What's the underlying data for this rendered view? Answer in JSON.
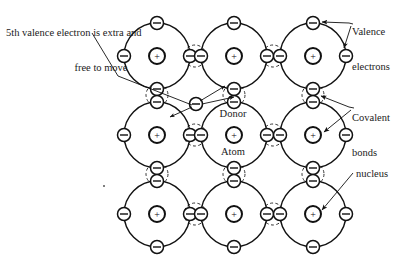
{
  "figure": {
    "background_color": "#ffffff",
    "ink_color": "#111111"
  },
  "labels": {
    "extra_electron_line1": "5th valence electron is extra and",
    "extra_electron_line2": "free to move",
    "valence_line1": "Valence",
    "valence_line2": "electrons",
    "covalent_line1": "Covalent",
    "covalent_line2": "bonds",
    "nucleus": "nucleus",
    "donor_line1": "Donor",
    "donor_line2": "Atom"
  },
  "symbols": {
    "nucleus_charge": "+",
    "electron_charge": "–"
  },
  "lattice": {
    "rows": 3,
    "cols": 3,
    "atom_radius": 33,
    "nucleus_outer_radius": 8,
    "nucleus_inner_radius": 5,
    "electron_radius": 6.5,
    "bond_circle_radius": 11,
    "atoms": [
      {
        "id": "atom-r1c1",
        "cx": 157,
        "cy": 56,
        "role": "lattice-atom"
      },
      {
        "id": "atom-r1c2",
        "cx": 234,
        "cy": 56,
        "role": "lattice-atom"
      },
      {
        "id": "atom-r1c3",
        "cx": 313,
        "cy": 56,
        "role": "lattice-atom"
      },
      {
        "id": "atom-r2c1",
        "cx": 157,
        "cy": 135,
        "role": "lattice-atom"
      },
      {
        "id": "atom-r2c2",
        "cx": 234,
        "cy": 135,
        "role": "donor-atom"
      },
      {
        "id": "atom-r2c3",
        "cx": 313,
        "cy": 135,
        "role": "lattice-atom"
      },
      {
        "id": "atom-r3c1",
        "cx": 157,
        "cy": 214,
        "role": "lattice-atom"
      },
      {
        "id": "atom-r3c2",
        "cx": 234,
        "cy": 214,
        "role": "lattice-atom"
      },
      {
        "id": "atom-r3c3",
        "cx": 313,
        "cy": 214,
        "role": "lattice-atom"
      }
    ],
    "horizontal_bonds": [
      {
        "id": "bond-h-r1c1c2",
        "cx": 195,
        "cy": 56
      },
      {
        "id": "bond-h-r1c2c3",
        "cx": 273,
        "cy": 56
      },
      {
        "id": "bond-h-r2c1c2",
        "cx": 195,
        "cy": 135
      },
      {
        "id": "bond-h-r2c2c3",
        "cx": 273,
        "cy": 135
      },
      {
        "id": "bond-h-r3c1c2",
        "cx": 195,
        "cy": 214
      },
      {
        "id": "bond-h-r3c2c3",
        "cx": 273,
        "cy": 214
      }
    ],
    "vertical_bonds": [
      {
        "id": "bond-v-c1r1r2",
        "cx": 157,
        "cy": 95
      },
      {
        "id": "bond-v-c2r1r2",
        "cx": 234,
        "cy": 95
      },
      {
        "id": "bond-v-c3r1r2",
        "cx": 313,
        "cy": 95
      },
      {
        "id": "bond-v-c1r2r3",
        "cx": 157,
        "cy": 174
      },
      {
        "id": "bond-v-c2r2r3",
        "cx": 234,
        "cy": 174
      },
      {
        "id": "bond-v-c3r2r3",
        "cx": 313,
        "cy": 174
      }
    ],
    "free_electron": {
      "id": "free-electron",
      "cx": 196,
      "cy": 104
    }
  },
  "leaders": {
    "extra_electron": "from caption at (95,38) down to free electron at (196,104)",
    "valence": "from label to top electron of atom-r1c3 and right electron of atom-r1c3",
    "covalent": "from label to vertical bond below atom-r1c3 and to electrons of atom-r2c3",
    "nucleus": "from label to nucleus of atom-r3c3",
    "motion_arrows": "three arrows radiating from the free electron toward the donor region"
  },
  "dot_marker": {
    "id": "stray-dot",
    "cx": 104,
    "cy": 186
  }
}
